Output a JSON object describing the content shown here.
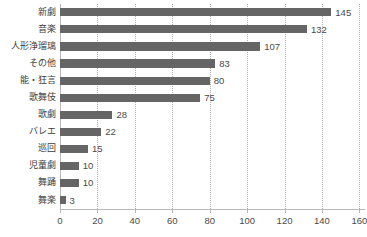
{
  "chart_data": {
    "type": "bar",
    "orientation": "horizontal",
    "title": "",
    "subtitle": "",
    "xlabel": "",
    "ylabel": "",
    "categories": [
      "新劇",
      "音楽",
      "人形浄瑠璃",
      "その他",
      "能・狂言",
      "歌舞伎",
      "歌劇",
      "バレエ",
      "巡回",
      "児童劇",
      "舞踊",
      "舞楽"
    ],
    "values": [
      145,
      132,
      107,
      83,
      80,
      75,
      28,
      22,
      15,
      10,
      10,
      3
    ],
    "data_labels": [
      "145",
      "132",
      "107",
      "83",
      "80",
      "75",
      "28",
      "22",
      "15",
      "10",
      "10",
      "3"
    ],
    "xlim": [
      0,
      163
    ],
    "xticks": [
      0,
      20,
      40,
      60,
      80,
      100,
      120,
      140,
      160
    ],
    "xtick_labels": [
      "0",
      "20",
      "40",
      "60",
      "80",
      "100",
      "120",
      "140",
      "160"
    ],
    "grid": "vertical-dotted",
    "legend": null,
    "colors": {
      "bar": "#656565",
      "axis": "#b9b9b9",
      "grid": "#b0b0b0",
      "text": "#4a4a4a",
      "background": "#ffffff"
    }
  }
}
